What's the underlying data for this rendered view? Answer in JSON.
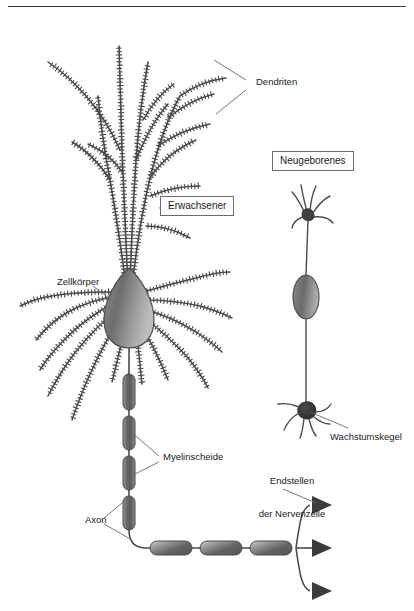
{
  "figure": {
    "title_rule": true,
    "panels": [
      {
        "key": "adult",
        "label": "Erwachsener"
      },
      {
        "key": "newborn",
        "label": "Neugeborenes"
      }
    ]
  },
  "labels": {
    "dendriten": "Dendriten",
    "erwachsener": "Erwachsener",
    "neugeborenes": "Neugeborenes",
    "zellkoerper": "Zellkörper",
    "myelinscheide": "Myelinscheide",
    "axon": "Axon",
    "endstellen_line1": "Endstellen",
    "endstellen_line2": "der Nervenzelle",
    "wachstumskegel": "Wachstumskegel"
  },
  "colors": {
    "ink": "#3a3a3a",
    "text": "#1a1a1a",
    "soma_dark": "#6f6f6f",
    "soma_light": "#b4b4b4",
    "myelin_dark": "#5e5e5e",
    "myelin_light": "#c2c2c2",
    "terminal": "#3c3c3c",
    "leader": "#6a6a6a",
    "box_border": "#6a6a6a",
    "background": "#ffffff"
  },
  "structures": {
    "adult": {
      "dendrite_count": 17,
      "spines": "dendritic spines rendered as short perpendicular ticks",
      "soma_shape": "teardrop",
      "myelin_segments_vertical": 4,
      "myelin_segments_horizontal": 3,
      "terminal_count": 3
    },
    "newborn": {
      "dendrite_count": 6,
      "soma_shape": "oval",
      "axon": "thin unmyelinated",
      "growth_cone_filaments": 6
    }
  }
}
